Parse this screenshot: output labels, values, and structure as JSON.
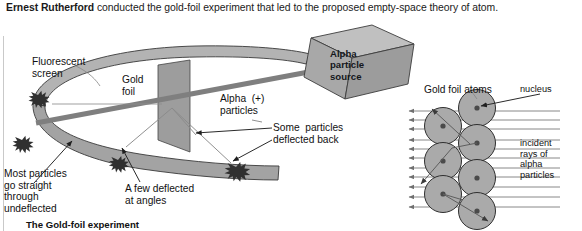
{
  "page": {
    "title": "The Gold-foil experiment",
    "background": "#ffffff"
  },
  "intro": {
    "lead": "Ernest Rutherford",
    "rest": " conducted the gold-foil experiment that  led  to the proposed empty-space theory of atom."
  },
  "diagram": {
    "labels": {
      "fluorescent_screen": "Fluorescent\nscreen",
      "gold_foil": "Gold\nfoil",
      "alpha_particles": "Alpha  (+)\nparticles",
      "alpha_source": "Alpha\nparticle\nsource",
      "some_deflected_back": "Some  particles\ndeflected back",
      "most_particles": "Most particles\ngo straight\nthrough\nundeflected",
      "few_deflected": "A few deflected\nat angles",
      "gold_foil_atoms": "Gold foil atoms",
      "nucleus": "nucleus",
      "incident_rays": "incident\nrays of\nalpha\nparticles"
    },
    "caption": "The Gold-foil experiment",
    "colors": {
      "screen_band": "#a6a6a6",
      "screen_band_far": "#bdbdbd",
      "foil": "#9a9a9a",
      "beam": "#858585",
      "source_front": "#a8a8a8",
      "source_top": "#bcbcbc",
      "source_side": "#8e8e8e",
      "atom": "#a9a9a9",
      "nucleus_dot": "#4a4a4a",
      "scintillation": "#3a3a3a",
      "ray": "#7c7c7c",
      "outline": "#2a2a2a",
      "rule": "#c9c9c9"
    },
    "atom_grid": {
      "columns": 2,
      "left_column_atoms": 3,
      "right_column_atoms": 4,
      "radius_px": 18
    },
    "incident_ray_count": 11,
    "scintillation_count": 4
  }
}
